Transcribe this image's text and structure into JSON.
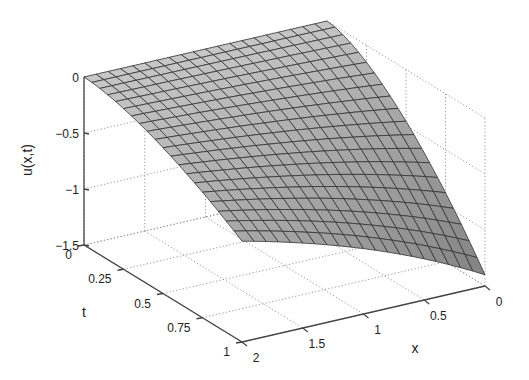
{
  "chart_data": {
    "type": "surface3d",
    "title": "",
    "xlabel": "x",
    "ylabel": "t",
    "zlabel": "u(x,t)",
    "xlim": [
      0,
      2
    ],
    "ylim": [
      0,
      1
    ],
    "zlim": [
      -1.5,
      0
    ],
    "x_ticks": [
      0,
      0.5,
      1,
      1.5,
      2
    ],
    "x_tick_labels": [
      "0",
      "0.5",
      "1",
      "1.5",
      "2"
    ],
    "t_ticks": [
      0,
      0.25,
      0.5,
      0.75,
      1
    ],
    "t_tick_labels": [
      "0",
      "0.25",
      "0.5",
      "0.75",
      "1"
    ],
    "z_ticks": [
      0,
      -0.5,
      -1,
      -1.5
    ],
    "z_tick_labels": [
      "0",
      "-0.5",
      "-1",
      "-1.5"
    ],
    "grid": true,
    "grid_style": "dotted",
    "mesh": {
      "nx": 21,
      "nt": 21
    },
    "surface_color": "#c8c8c8",
    "edge_color": "#333333",
    "corner_values": {
      "x0_t0": 0.0,
      "x2_t0": 0.0,
      "x0_t1": -1.4,
      "x2_t1": -0.6
    }
  }
}
